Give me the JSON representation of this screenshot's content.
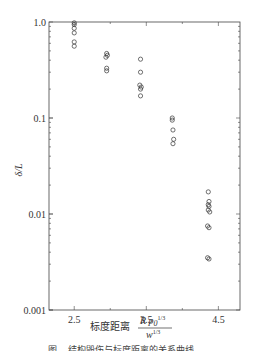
{
  "chart_data": {
    "type": "scatter",
    "title": "",
    "xlabel": "标度距离",
    "xlabel_formula": {
      "numerator": "R p0^1/3",
      "denominator": "w^1/3"
    },
    "ylabel": "δ/L",
    "yscale": "log",
    "ylim": [
      0.001,
      1.0
    ],
    "xlim": [
      2.15,
      4.8
    ],
    "x_ticks": [
      2.5,
      3.5,
      4.5
    ],
    "x_tick_labels": [
      "2.5",
      "3.5",
      "4.5"
    ],
    "y_ticks": [
      1.0,
      0.1,
      0.01,
      0.001
    ],
    "y_tick_labels": [
      "1.0",
      "0.1",
      "0.01",
      "0.001"
    ],
    "grid": false,
    "legend": null,
    "marker": "open-circle",
    "series": [
      {
        "name": "data",
        "points": [
          [
            2.5,
            0.98
          ],
          [
            2.5,
            0.94
          ],
          [
            2.5,
            0.86
          ],
          [
            2.5,
            0.77
          ],
          [
            2.5,
            0.62
          ],
          [
            2.5,
            0.56
          ],
          [
            2.95,
            0.47
          ],
          [
            2.96,
            0.45
          ],
          [
            2.94,
            0.43
          ],
          [
            2.95,
            0.33
          ],
          [
            2.95,
            0.31
          ],
          [
            3.42,
            0.41
          ],
          [
            3.42,
            0.3
          ],
          [
            3.41,
            0.22
          ],
          [
            3.43,
            0.21
          ],
          [
            3.42,
            0.2
          ],
          [
            3.42,
            0.17
          ],
          [
            3.86,
            0.1
          ],
          [
            3.86,
            0.095
          ],
          [
            3.87,
            0.075
          ],
          [
            3.88,
            0.06
          ],
          [
            3.87,
            0.054
          ],
          [
            4.36,
            0.017
          ],
          [
            4.37,
            0.0135
          ],
          [
            4.36,
            0.0125
          ],
          [
            4.37,
            0.012
          ],
          [
            4.36,
            0.011
          ],
          [
            4.38,
            0.0105
          ],
          [
            4.35,
            0.0075
          ],
          [
            4.37,
            0.0072
          ],
          [
            4.35,
            0.0035
          ],
          [
            4.37,
            0.0034
          ]
        ]
      }
    ]
  },
  "caption": "图… 结构毁伤与标度距离的关系曲线……"
}
